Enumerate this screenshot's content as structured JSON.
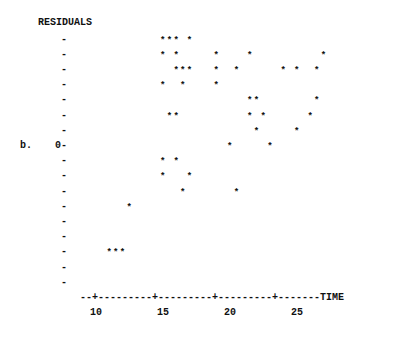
{
  "chart_data": {
    "type": "scatter",
    "title": "",
    "panel_label": "b.",
    "xlabel": "TIME",
    "ylabel": "RESIDUALS",
    "x_ticks": [
      10,
      15,
      20,
      25
    ],
    "y_zero_label": "0",
    "y_tick_levels": [
      7,
      6,
      5,
      4,
      3,
      2,
      1,
      0,
      -1,
      -2,
      -3,
      -4,
      -5,
      -6,
      -7,
      -8,
      -9
    ],
    "xlim": [
      8.8,
      28.7
    ],
    "ylim": [
      -9,
      7
    ],
    "grid": false,
    "marker": "*",
    "points": [
      {
        "x": 15,
        "y": 7
      },
      {
        "x": 15.5,
        "y": 7
      },
      {
        "x": 16,
        "y": 7
      },
      {
        "x": 17,
        "y": 7
      },
      {
        "x": 15,
        "y": 6
      },
      {
        "x": 16,
        "y": 6
      },
      {
        "x": 19,
        "y": 6
      },
      {
        "x": 21.5,
        "y": 6
      },
      {
        "x": 27,
        "y": 6
      },
      {
        "x": 16,
        "y": 5
      },
      {
        "x": 16.5,
        "y": 5
      },
      {
        "x": 17,
        "y": 5
      },
      {
        "x": 19,
        "y": 5
      },
      {
        "x": 20.5,
        "y": 5
      },
      {
        "x": 24,
        "y": 5
      },
      {
        "x": 25,
        "y": 5
      },
      {
        "x": 26.5,
        "y": 5
      },
      {
        "x": 15,
        "y": 4
      },
      {
        "x": 16.5,
        "y": 4
      },
      {
        "x": 19,
        "y": 4
      },
      {
        "x": 21.5,
        "y": 3
      },
      {
        "x": 22,
        "y": 3
      },
      {
        "x": 26.5,
        "y": 3
      },
      {
        "x": 15.5,
        "y": 2
      },
      {
        "x": 16,
        "y": 2
      },
      {
        "x": 21.5,
        "y": 2
      },
      {
        "x": 22.5,
        "y": 2
      },
      {
        "x": 26,
        "y": 2
      },
      {
        "x": 22,
        "y": 1
      },
      {
        "x": 25,
        "y": 1
      },
      {
        "x": 20,
        "y": 0
      },
      {
        "x": 23,
        "y": 0
      },
      {
        "x": 15,
        "y": -1
      },
      {
        "x": 16,
        "y": -1
      },
      {
        "x": 15,
        "y": -2
      },
      {
        "x": 17,
        "y": -2
      },
      {
        "x": 16.5,
        "y": -3
      },
      {
        "x": 20.5,
        "y": -3
      },
      {
        "x": 12.5,
        "y": -4
      },
      {
        "x": 11,
        "y": -7
      },
      {
        "x": 11.5,
        "y": -7
      },
      {
        "x": 12,
        "y": -7
      }
    ]
  },
  "labels": {
    "ylabel": "RESIDUALS",
    "panel": "b.",
    "zero": "0-",
    "tick": "-",
    "xaxis_line": "--+---------+---------+---------+-------TIME",
    "x10": "10",
    "x15": "15",
    "x20": "20",
    "x25": "25",
    "star": "*"
  }
}
